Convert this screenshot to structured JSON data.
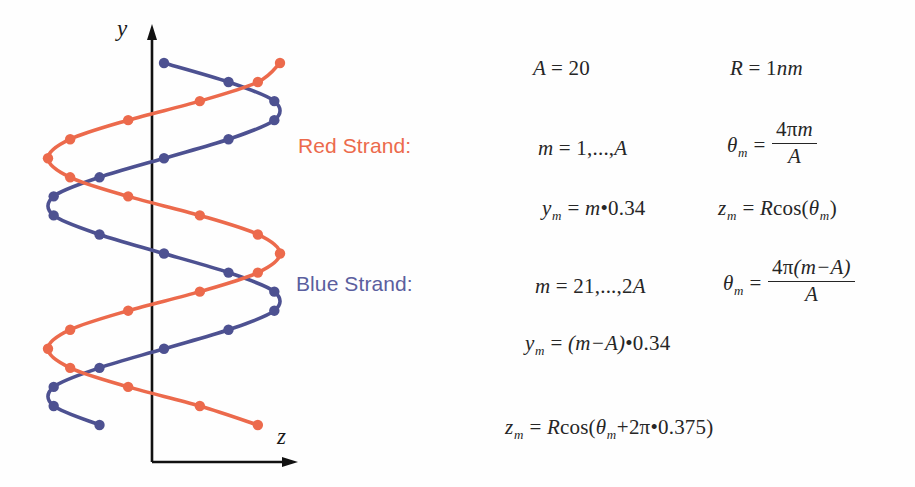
{
  "figure": {
    "background": "#fefefe",
    "axes": {
      "y_label": "y",
      "z_label": "z",
      "axis_color": "#111111"
    },
    "colors": {
      "red_strand": "#ec6a4c",
      "blue_strand": "#4d5191",
      "red_strand_label": "#ec6a4c",
      "blue_strand_label": "#5b5f9e",
      "equation_text": "#262626"
    }
  },
  "labels": {
    "red_strand": "Red Strand:",
    "blue_strand": "Blue Strand:"
  },
  "equations": {
    "A": {
      "lhs": "A",
      "eq": "=",
      "rhs": "20"
    },
    "R": {
      "lhs": "R",
      "eq": "=",
      "rhs": "1",
      "unit": "nm"
    },
    "red": {
      "range": {
        "lhs": "m",
        "eq": "=",
        "rhs": "1,...,",
        "rhs2": "A"
      },
      "theta": {
        "lhs": "θ",
        "sub": "m",
        "eq": "=",
        "num_coef": "4",
        "num_pi": "π",
        "num_var": "m",
        "den": "A"
      },
      "y": {
        "lhs": "y",
        "sub": "m",
        "eq": "=",
        "var": "m",
        "dot": "•",
        "value": "0.34"
      },
      "z": {
        "lhs": "z",
        "sub": "m",
        "eq": "=",
        "radius": "R",
        "fn": "cos(",
        "arg": "θ",
        "arg_sub": "m",
        "close": ")"
      }
    },
    "blue": {
      "range": {
        "lhs": "m",
        "eq": "=",
        "rhs": "21,...,2",
        "rhs2": "A"
      },
      "theta": {
        "lhs": "θ",
        "sub": "m",
        "eq": "=",
        "num_coef": "4",
        "num_pi": "π",
        "num_expr": "(m−A)",
        "den": "A"
      },
      "y": {
        "lhs": "y",
        "sub": "m",
        "eq": "=",
        "expr": "(m−A)",
        "dot": "•",
        "value": "0.34"
      },
      "z": {
        "lhs": "z",
        "sub": "m",
        "eq": "=",
        "radius": "R",
        "fn": "cos(",
        "arg": "θ",
        "arg_sub": "m",
        "plus": "+",
        "two": "2",
        "pi": "π",
        "dot": "•",
        "phase": "0.375",
        "close": ")"
      }
    }
  },
  "chart_data": {
    "type": "line",
    "title": "",
    "xlabel": "z",
    "ylabel": "y",
    "grid": false,
    "legend": "none",
    "parameters": {
      "A": 20,
      "R_nm": 1,
      "rise_per_base_nm": 0.34,
      "blue_phase_turns": 0.375,
      "red_m_range": [
        1,
        20
      ],
      "blue_m_range": [
        21,
        40
      ]
    },
    "axis_ranges": {
      "z": [
        -1,
        1
      ],
      "y": [
        0.34,
        6.8
      ]
    },
    "series": [
      {
        "name": "Red Strand",
        "color": "#ec6a4c",
        "marker": "circle",
        "m": [
          1,
          2,
          3,
          4,
          5,
          6,
          7,
          8,
          9,
          10,
          11,
          12,
          13,
          14,
          15,
          16,
          17,
          18,
          19,
          20
        ],
        "y": [
          0.34,
          0.68,
          1.02,
          1.36,
          1.7,
          2.04,
          2.38,
          2.72,
          3.06,
          3.4,
          3.74,
          4.08,
          4.42,
          4.76,
          5.1,
          5.44,
          5.78,
          6.12,
          6.46,
          6.8
        ],
        "z": [
          0.809,
          0.309,
          -0.309,
          -0.809,
          -1.0,
          -0.809,
          -0.309,
          0.309,
          0.809,
          1.0,
          0.809,
          0.309,
          -0.309,
          -0.809,
          -1.0,
          -0.809,
          -0.309,
          0.309,
          0.809,
          1.0
        ]
      },
      {
        "name": "Blue Strand",
        "color": "#4d5191",
        "marker": "circle",
        "m": [
          21,
          22,
          23,
          24,
          25,
          26,
          27,
          28,
          29,
          30,
          31,
          32,
          33,
          34,
          35,
          36,
          37,
          38,
          39,
          40
        ],
        "y": [
          0.34,
          0.68,
          1.02,
          1.36,
          1.7,
          2.04,
          2.38,
          2.72,
          3.06,
          3.4,
          3.74,
          4.08,
          4.42,
          4.76,
          5.1,
          5.44,
          5.78,
          6.12,
          6.46,
          6.8
        ],
        "z": [
          -0.556,
          -0.951,
          -0.951,
          -0.556,
          0.0,
          0.556,
          0.951,
          0.951,
          0.556,
          0.0,
          -0.556,
          -0.951,
          -0.951,
          -0.556,
          0.0,
          0.556,
          0.951,
          0.951,
          0.556,
          0.0
        ]
      }
    ]
  }
}
